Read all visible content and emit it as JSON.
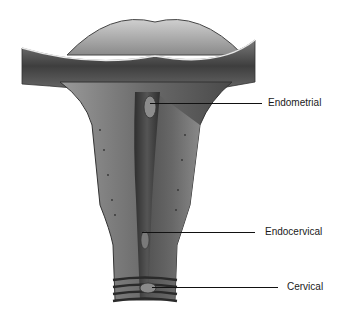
{
  "diagram": {
    "labels": [
      {
        "id": "endometrial",
        "text": "Endometrial"
      },
      {
        "id": "endocervical",
        "text": "Endocervical"
      },
      {
        "id": "cervical",
        "text": "Cervical"
      }
    ],
    "colors": {
      "background": "#ffffff",
      "tissue_dark": "#3a3a3a",
      "tissue_mid": "#6e6e6e",
      "tissue_light": "#a8a8a8",
      "label_text": "#1a1a1a"
    }
  }
}
